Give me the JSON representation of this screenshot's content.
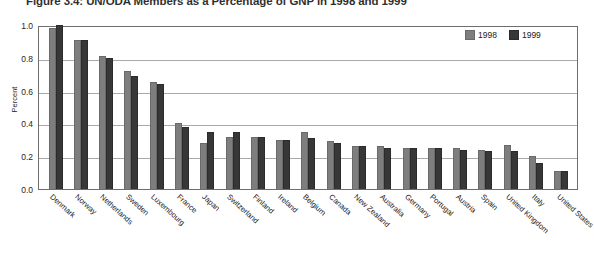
{
  "figure": {
    "title": "Figure 3.4: UN/ODA Members as a Percentage of GNP in 1998 and 1999"
  },
  "legend": {
    "position": "top-right",
    "items": [
      {
        "label": "1998",
        "color": "#7e7e7e",
        "swatch": "legend-swatch-1998"
      },
      {
        "label": "1999",
        "color": "#373737",
        "swatch": "legend-swatch-1999"
      }
    ]
  },
  "axes": {
    "y_title": "Percent",
    "y_ticks": [
      "0.0",
      "0.2",
      "0.4",
      "0.6",
      "0.8",
      "1.0"
    ]
  },
  "chart_data": {
    "type": "bar",
    "title": "Figure 3.4: UN/ODA Members as a Percentage of GNP in 1998 and 1999",
    "xlabel": "",
    "ylabel": "Percent",
    "ylim": [
      0.0,
      1.0
    ],
    "grid": true,
    "legend_position": "top-right",
    "categories": [
      "Denmark",
      "Norway",
      "Netherlands",
      "Sweden",
      "Luxembourg",
      "France",
      "Japan",
      "Switzerland",
      "Finland",
      "Ireland",
      "Belgium",
      "Canada",
      "New Zealand",
      "Australia",
      "Germany",
      "Portugal",
      "Austria",
      "Spain",
      "United Kingdom",
      "Italy",
      "United States"
    ],
    "series": [
      {
        "name": "1998",
        "color": "#7e7e7e",
        "values": [
          0.98,
          0.91,
          0.81,
          0.72,
          0.65,
          0.4,
          0.28,
          0.32,
          0.32,
          0.3,
          0.35,
          0.29,
          0.26,
          0.26,
          0.25,
          0.25,
          0.25,
          0.24,
          0.27,
          0.2,
          0.11
        ]
      },
      {
        "name": "1999",
        "color": "#373737",
        "values": [
          1.0,
          0.91,
          0.8,
          0.69,
          0.64,
          0.38,
          0.35,
          0.35,
          0.32,
          0.3,
          0.31,
          0.28,
          0.26,
          0.25,
          0.25,
          0.25,
          0.24,
          0.23,
          0.23,
          0.16,
          0.11
        ]
      }
    ]
  }
}
